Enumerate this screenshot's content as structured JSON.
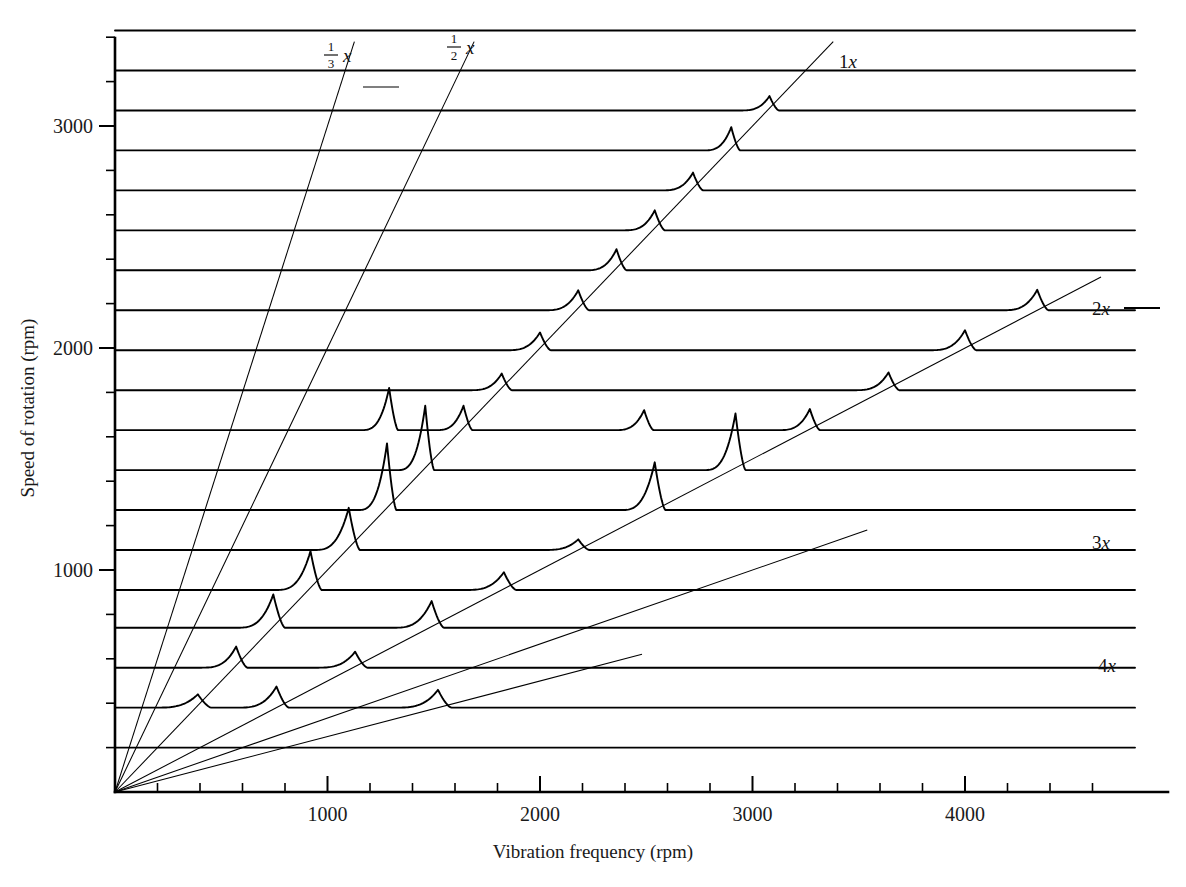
{
  "figure": {
    "title": "",
    "background": "#ffffff",
    "ink_color": "#000000"
  },
  "axes": {
    "x_title": "Vibration frequency (rpm)",
    "y_title": "Speed of rotation (rpm)",
    "x_major_labels": [
      "1000",
      "2000",
      "3000",
      "4000"
    ],
    "y_major_labels": [
      "1000",
      "2000",
      "3000"
    ]
  },
  "order_labels": {
    "third": {
      "numerator": "1",
      "denominator": "3",
      "symbol": "x"
    },
    "half": {
      "numerator": "1",
      "denominator": "2",
      "symbol": "x"
    },
    "one": "1x",
    "two": "2x",
    "three": "3x",
    "four": "4x"
  },
  "chart_data": {
    "type": "line",
    "title": "",
    "subtitle": "",
    "xlabel": "Vibration frequency (rpm)",
    "ylabel": "Speed of rotation (rpm)",
    "xlim": [
      0,
      4750
    ],
    "ylim": [
      0,
      3580
    ],
    "grid": false,
    "legend_position": "inline-right",
    "style": "waterfall cascade diagram (spectral map): each horizontal trace is a vibration spectrum recorded at one shaft speed; baselines are stacked by speed of rotation",
    "x_ticks_major": [
      1000,
      2000,
      3000,
      4000
    ],
    "x_ticks_minor_step": 200,
    "y_ticks_major": [
      1000,
      2000,
      3000
    ],
    "y_ticks_minor_step": 200,
    "order_lines": [
      {
        "name": "1/3 x",
        "order": 0.3333,
        "label": "⅓x",
        "label_at_rpm": 3380,
        "emphasis": "thin"
      },
      {
        "name": "1/2 x",
        "order": 0.5,
        "label": "½x",
        "label_at_rpm": 3380,
        "emphasis": "thin"
      },
      {
        "name": "1x",
        "order": 1.0,
        "label": "1x",
        "label_at_rpm": 3380,
        "emphasis": "thin"
      },
      {
        "name": "2x",
        "order": 2.0,
        "label": "2x",
        "label_at_rpm": 2320,
        "emphasis": "thin"
      },
      {
        "name": "3x",
        "order": 3.0,
        "label": "3x",
        "label_at_rpm": 1180,
        "emphasis": "thin"
      },
      {
        "name": "4x",
        "order": 4.0,
        "label": "4x",
        "label_at_rpm": 620,
        "emphasis": "thin"
      }
    ],
    "traces": [
      {
        "speed_rpm": 200,
        "peaks": []
      },
      {
        "speed_rpm": 380,
        "peaks": [
          {
            "freq_rpm": 390,
            "height_rpm": 60,
            "width_rpm": 60,
            "order": "1x"
          },
          {
            "freq_rpm": 760,
            "height_rpm": 95,
            "width_rpm": 55,
            "order": "2x"
          },
          {
            "freq_rpm": 1520,
            "height_rpm": 80,
            "width_rpm": 60,
            "order": "4x"
          }
        ]
      },
      {
        "speed_rpm": 560,
        "peaks": [
          {
            "freq_rpm": 570,
            "height_rpm": 95,
            "width_rpm": 50,
            "order": "1x"
          },
          {
            "freq_rpm": 1130,
            "height_rpm": 72,
            "width_rpm": 55,
            "order": "2x"
          }
        ]
      },
      {
        "speed_rpm": 740,
        "peaks": [
          {
            "freq_rpm": 745,
            "height_rpm": 150,
            "width_rpm": 52,
            "order": "1x"
          },
          {
            "freq_rpm": 1490,
            "height_rpm": 120,
            "width_rpm": 55,
            "order": "2x"
          }
        ]
      },
      {
        "speed_rpm": 910,
        "peaks": [
          {
            "freq_rpm": 920,
            "height_rpm": 175,
            "width_rpm": 50,
            "order": "1x"
          },
          {
            "freq_rpm": 1830,
            "height_rpm": 80,
            "width_rpm": 55,
            "order": "2x"
          }
        ]
      },
      {
        "speed_rpm": 1090,
        "peaks": [
          {
            "freq_rpm": 1100,
            "height_rpm": 190,
            "width_rpm": 50,
            "order": "1x"
          },
          {
            "freq_rpm": 2180,
            "height_rpm": 48,
            "width_rpm": 50,
            "order": "2x"
          }
        ]
      },
      {
        "speed_rpm": 1270,
        "peaks": [
          {
            "freq_rpm": 1280,
            "height_rpm": 300,
            "width_rpm": 42,
            "order": "1x"
          },
          {
            "freq_rpm": 2540,
            "height_rpm": 215,
            "width_rpm": 48,
            "order": "2x"
          }
        ]
      },
      {
        "speed_rpm": 1450,
        "peaks": [
          {
            "freq_rpm": 1460,
            "height_rpm": 290,
            "width_rpm": 40,
            "order": "1x"
          },
          {
            "freq_rpm": 2920,
            "height_rpm": 255,
            "width_rpm": 45,
            "order": "2x"
          }
        ]
      },
      {
        "speed_rpm": 1630,
        "peaks": [
          {
            "freq_rpm": 1290,
            "height_rpm": 190,
            "width_rpm": 40,
            "order": "other"
          },
          {
            "freq_rpm": 1640,
            "height_rpm": 110,
            "width_rpm": 40,
            "order": "1x"
          },
          {
            "freq_rpm": 2490,
            "height_rpm": 90,
            "width_rpm": 42,
            "order": "other"
          },
          {
            "freq_rpm": 3270,
            "height_rpm": 95,
            "width_rpm": 45,
            "order": "2x"
          }
        ]
      },
      {
        "speed_rpm": 1810,
        "peaks": [
          {
            "freq_rpm": 1820,
            "height_rpm": 75,
            "width_rpm": 45,
            "order": "1x"
          },
          {
            "freq_rpm": 3640,
            "height_rpm": 80,
            "width_rpm": 48,
            "order": "2x"
          }
        ]
      },
      {
        "speed_rpm": 1990,
        "peaks": [
          {
            "freq_rpm": 2000,
            "height_rpm": 80,
            "width_rpm": 48,
            "order": "1x"
          },
          {
            "freq_rpm": 4000,
            "height_rpm": 90,
            "width_rpm": 50,
            "order": "2x"
          }
        ]
      },
      {
        "speed_rpm": 2170,
        "peaks": [
          {
            "freq_rpm": 2180,
            "height_rpm": 90,
            "width_rpm": 48,
            "order": "1x"
          },
          {
            "freq_rpm": 4340,
            "height_rpm": 92,
            "width_rpm": 50,
            "order": "2x"
          }
        ]
      },
      {
        "speed_rpm": 2350,
        "peaks": [
          {
            "freq_rpm": 2360,
            "height_rpm": 95,
            "width_rpm": 45,
            "order": "1x"
          }
        ]
      },
      {
        "speed_rpm": 2530,
        "peaks": [
          {
            "freq_rpm": 2540,
            "height_rpm": 90,
            "width_rpm": 45,
            "order": "1x"
          }
        ]
      },
      {
        "speed_rpm": 2710,
        "peaks": [
          {
            "freq_rpm": 2720,
            "height_rpm": 80,
            "width_rpm": 45,
            "order": "1x"
          }
        ]
      },
      {
        "speed_rpm": 2890,
        "peaks": [
          {
            "freq_rpm": 2900,
            "height_rpm": 105,
            "width_rpm": 40,
            "order": "1x"
          }
        ]
      },
      {
        "speed_rpm": 3070,
        "peaks": [
          {
            "freq_rpm": 3080,
            "height_rpm": 65,
            "width_rpm": 42,
            "order": "1x"
          }
        ]
      },
      {
        "speed_rpm": 3250,
        "peaks": []
      },
      {
        "speed_rpm": 3430,
        "peaks": []
      }
    ]
  }
}
